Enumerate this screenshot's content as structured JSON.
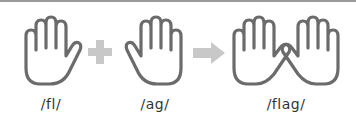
{
  "diagram": {
    "title": "",
    "parts": [
      {
        "id": "hand-1",
        "icon": "open-hand-icon",
        "label": "/fl/"
      },
      {
        "id": "hand-2",
        "icon": "open-hand-icon",
        "label": "/ag/"
      },
      {
        "id": "hands-joined",
        "icon": "two-hands-joined-icon",
        "label": "/flag/"
      }
    ],
    "operators": [
      {
        "type": "plus",
        "icon": "plus-icon"
      },
      {
        "type": "arrow",
        "icon": "arrow-right-icon"
      }
    ],
    "colors": {
      "outline": "#6b6b6b",
      "operator": "#c8c8c8",
      "text": "#333333"
    }
  }
}
